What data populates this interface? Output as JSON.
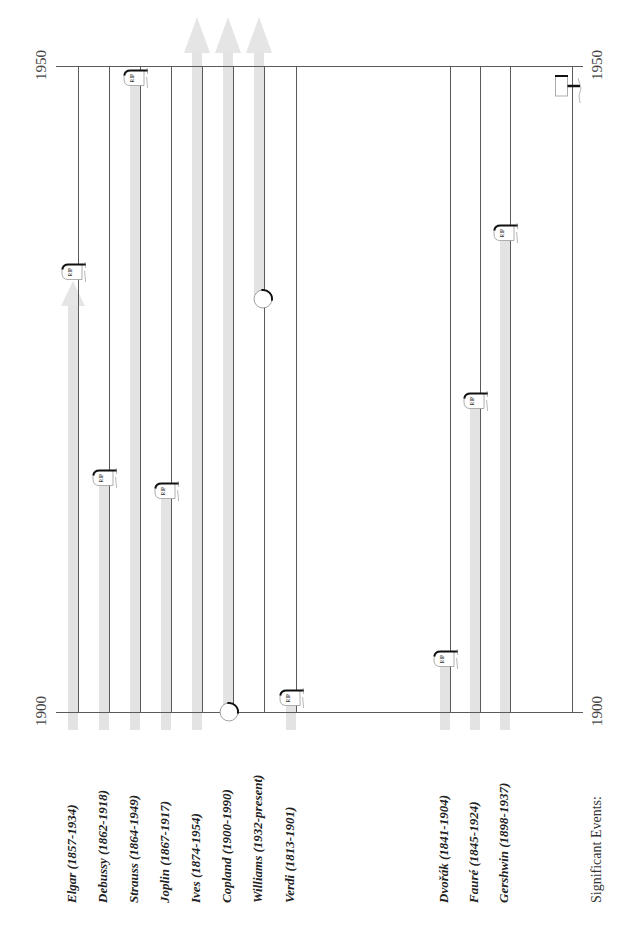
{
  "axis": {
    "top_left": "1950",
    "top_right": "1950",
    "bottom_left": "1900",
    "bottom_right": "1900"
  },
  "events": {
    "label": "Significant Events:",
    "markers": [
      {
        "icon": "event-marker-icon",
        "approx_year": 1948
      }
    ]
  },
  "chart_data": {
    "type": "bar",
    "orientation": "vertical timeline (lifespan ranges)",
    "title": "",
    "xlabel": "",
    "ylabel": "Year",
    "ylim": [
      1900,
      1950
    ],
    "y_tick_labels": [
      "1900",
      "1950"
    ],
    "grid": false,
    "legend": null,
    "categories": [
      "Elgar (1857-1934)",
      "Debussy (1862-1918)",
      "Strauss (1864-1949)",
      "Joplin (1867-1917)",
      "Ives (1874-1954)",
      "Copland (1900-1990)",
      "Williams (1932-present)",
      "Verdi (1813-1901)",
      "Dvořák (1841-1904)",
      "Fauré (1845-1924)",
      "Gershwin (1898-1937)"
    ],
    "composers": [
      {
        "name": "Elgar",
        "label": "Elgar (1857-1934)",
        "birth": 1857,
        "death": 1934,
        "start_marker": null,
        "end_marker": "arrow+tombstone"
      },
      {
        "name": "Debussy",
        "label": "Debussy (1862-1918)",
        "birth": 1862,
        "death": 1918,
        "start_marker": null,
        "end_marker": "tombstone"
      },
      {
        "name": "Strauss",
        "label": "Strauss (1864-1949)",
        "birth": 1864,
        "death": 1949,
        "start_marker": null,
        "end_marker": "tombstone"
      },
      {
        "name": "Joplin",
        "label": "Joplin (1867-1917)",
        "birth": 1867,
        "death": 1917,
        "start_marker": null,
        "end_marker": "tombstone"
      },
      {
        "name": "Ives",
        "label": "Ives (1874-1954)",
        "birth": 1874,
        "death": 1954,
        "start_marker": null,
        "end_marker": "arrow-up"
      },
      {
        "name": "Copland",
        "label": "Copland (1900-1990)",
        "birth": 1900,
        "death": 1990,
        "start_marker": "circle",
        "end_marker": "arrow-up"
      },
      {
        "name": "Williams",
        "label": "Williams (1932-present)",
        "birth": 1932,
        "death": null,
        "start_marker": "circle",
        "end_marker": "arrow-up"
      },
      {
        "name": "Verdi",
        "label": "Verdi (1813-1901)",
        "birth": 1813,
        "death": 1901,
        "start_marker": null,
        "end_marker": "tombstone"
      },
      {
        "name": "Dvořák",
        "label": "Dvořák (1841-1904)",
        "birth": 1841,
        "death": 1904,
        "start_marker": null,
        "end_marker": "tombstone"
      },
      {
        "name": "Fauré",
        "label": "Fauré (1845-1924)",
        "birth": 1845,
        "death": 1924,
        "start_marker": null,
        "end_marker": "tombstone"
      },
      {
        "name": "Gershwin",
        "label": "Gershwin (1898-1937)",
        "birth": 1898,
        "death": 1937,
        "start_marker": null,
        "end_marker": "tombstone"
      }
    ],
    "tombstone_text": "RIP",
    "colors": {
      "bar": "#e3e3e3",
      "line": "#5a5a5a",
      "tombstone_edge": "#111111"
    }
  }
}
